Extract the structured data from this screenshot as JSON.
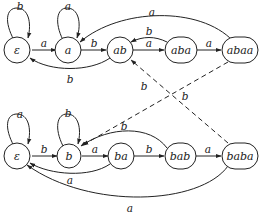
{
  "diagram": {
    "type": "automaton",
    "automata": [
      {
        "id": "top",
        "states": [
          {
            "id": "t_eps",
            "label": "ε"
          },
          {
            "id": "t_a",
            "label": "a"
          },
          {
            "id": "t_ab",
            "label": "ab"
          },
          {
            "id": "t_aba",
            "label": "aba"
          },
          {
            "id": "t_abaa",
            "label": "abaa"
          }
        ],
        "transitions": [
          {
            "from": "ε",
            "to": "ε",
            "label": "b"
          },
          {
            "from": "ε",
            "to": "a",
            "label": "a"
          },
          {
            "from": "a",
            "to": "a",
            "label": "a"
          },
          {
            "from": "a",
            "to": "ab",
            "label": "b"
          },
          {
            "from": "ab",
            "to": "ε",
            "label": "b"
          },
          {
            "from": "ab",
            "to": "aba",
            "label": "a"
          },
          {
            "from": "aba",
            "to": "ab",
            "label": "b"
          },
          {
            "from": "aba",
            "to": "abaa",
            "label": "a"
          },
          {
            "from": "abaa",
            "to": "a",
            "label": "a"
          }
        ]
      },
      {
        "id": "bottom",
        "states": [
          {
            "id": "b_eps",
            "label": "ε"
          },
          {
            "id": "b_b",
            "label": "b"
          },
          {
            "id": "b_ba",
            "label": "ba"
          },
          {
            "id": "b_bab",
            "label": "bab"
          },
          {
            "id": "b_baba",
            "label": "baba"
          }
        ],
        "transitions": [
          {
            "from": "ε",
            "to": "ε",
            "label": "a"
          },
          {
            "from": "ε",
            "to": "b",
            "label": "b"
          },
          {
            "from": "b",
            "to": "b",
            "label": "b"
          },
          {
            "from": "b",
            "to": "ba",
            "label": "a"
          },
          {
            "from": "ba",
            "to": "ε",
            "label": "a"
          },
          {
            "from": "ba",
            "to": "bab",
            "label": "b"
          },
          {
            "from": "bab",
            "to": "b",
            "label": "b"
          },
          {
            "from": "bab",
            "to": "baba",
            "label": "a"
          },
          {
            "from": "baba",
            "to": "ε",
            "label": "a"
          }
        ]
      }
    ],
    "cross_transitions": [
      {
        "from": "abaa",
        "to": "b",
        "label": "b",
        "style": "dashed"
      },
      {
        "from": "baba",
        "to": "ab",
        "label": "b",
        "style": "dashed"
      }
    ],
    "labels": {
      "top": {
        "eps": "ε",
        "a": "a",
        "ab": "ab",
        "aba": "aba",
        "abaa": "abaa",
        "loop_eps": "b",
        "eps_a": "a",
        "loop_a": "a",
        "a_ab": "b",
        "ab_eps": "b",
        "ab_aba": "a",
        "aba_ab": "b",
        "aba_abaa": "a",
        "abaa_a": "a"
      },
      "bottom": {
        "eps": "ε",
        "b": "b",
        "ba": "ba",
        "bab": "bab",
        "baba": "baba",
        "loop_eps": "a",
        "eps_b": "b",
        "loop_b": "b",
        "b_ba": "a",
        "ba_eps": "a",
        "ba_bab": "b",
        "bab_b": "b",
        "bab_baba": "a",
        "baba_eps": "a"
      },
      "cross": {
        "abaa_b": "b",
        "baba_ab": "b"
      }
    }
  }
}
